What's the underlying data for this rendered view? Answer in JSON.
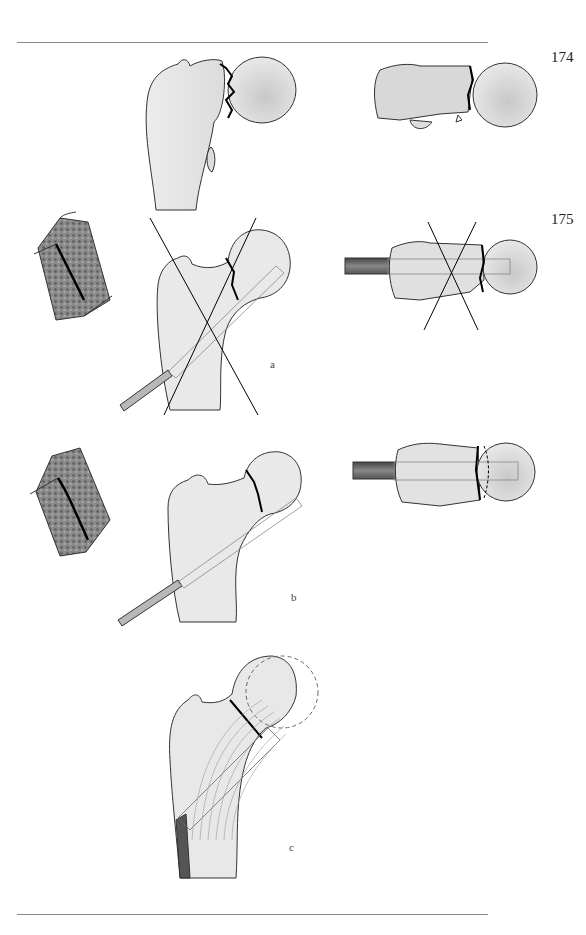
{
  "page": {
    "figure_numbers": [
      "174",
      "175"
    ],
    "sublabels": [
      "a",
      "b",
      "c"
    ]
  },
  "figures": [
    {
      "id": "174",
      "panels": [
        "femur-ap-fracture",
        "femur-axial-fracture"
      ]
    },
    {
      "id": "175",
      "sublabel": "a",
      "panels": [
        "bone-section-detail",
        "femur-ap-wrong-screw-crossed",
        "femur-axial-wrong-screw-crossed"
      ]
    },
    {
      "id": "175",
      "sublabel": "b",
      "panels": [
        "bone-section-detail-impacted",
        "femur-ap-correct-screw",
        "femur-axial-correct-screw"
      ]
    },
    {
      "id": "175",
      "sublabel": "c",
      "panels": [
        "femur-ap-trabecular-screw"
      ]
    }
  ],
  "colors": {
    "bone_fill": "#e6e6e6",
    "bone_shade": "#cfcfcf",
    "outline": "#333333",
    "fracture_line": "#000000",
    "cancellous": "#6a6a6a",
    "rule": "#8a8a8a"
  }
}
